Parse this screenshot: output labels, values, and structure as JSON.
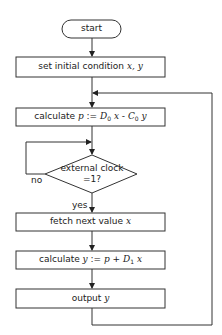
{
  "diagram": {
    "type": "flowchart",
    "nodes": {
      "start": {
        "shape": "terminal",
        "label": "start"
      },
      "init": {
        "shape": "process",
        "label_prefix": "set initial condition ",
        "label_vars": "x, y"
      },
      "calc_p": {
        "shape": "process",
        "label_prefix": "calculate ",
        "p": "p",
        "assign": " := ",
        "d0": "D",
        "d0_sub": "0",
        "x": " x",
        "minus": " - ",
        "c0": "C",
        "c0_sub": "0",
        "y": " y"
      },
      "decision": {
        "shape": "decision",
        "line1": "external clock",
        "line2": "=1?"
      },
      "fetch": {
        "shape": "process",
        "label_prefix": "fetch next value ",
        "label_var": "x"
      },
      "calc_y": {
        "shape": "process",
        "label_prefix": "calculate ",
        "y": "y",
        "assign": " := ",
        "p": "p",
        "plus": " + ",
        "d1": "D",
        "d1_sub": "1",
        "x": " x"
      },
      "output": {
        "shape": "process",
        "label_prefix": "output ",
        "label_var": "y"
      }
    },
    "edge_labels": {
      "no": "no",
      "yes": "yes"
    },
    "edges": [
      {
        "from": "start",
        "to": "init"
      },
      {
        "from": "init",
        "to": "calc_p"
      },
      {
        "from": "calc_p",
        "to": "decision"
      },
      {
        "from": "decision",
        "to": "decision",
        "label": "no"
      },
      {
        "from": "decision",
        "to": "fetch",
        "label": "yes"
      },
      {
        "from": "fetch",
        "to": "calc_y"
      },
      {
        "from": "calc_y",
        "to": "output"
      },
      {
        "from": "output",
        "to": "calc_p"
      }
    ]
  }
}
